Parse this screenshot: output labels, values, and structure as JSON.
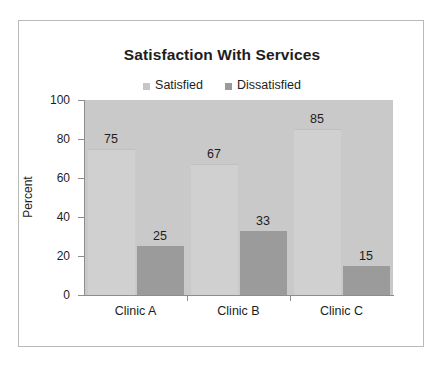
{
  "chart_data": {
    "type": "bar",
    "title": "Satisfaction With Services",
    "xlabel": "",
    "ylabel": "Percent",
    "categories": [
      "Clinic A",
      "Clinic B",
      "Clinic C"
    ],
    "series": [
      {
        "name": "Satisfied",
        "values": [
          75,
          67,
          85
        ],
        "color": "#d0d0d0"
      },
      {
        "name": "Dissatisfied",
        "values": [
          25,
          33,
          15
        ],
        "color": "#9b9b9b"
      }
    ],
    "ylim": [
      0,
      100
    ],
    "yticks": [
      0,
      20,
      40,
      60,
      80,
      100
    ],
    "ytick_labels": [
      "0",
      "20",
      "40",
      "60",
      "80",
      "100"
    ],
    "grid": false,
    "legend_position": "top",
    "plot_background": "#c9c9c9",
    "data_labels": [
      {
        "category": "Clinic A",
        "series": "Satisfied",
        "value": 75,
        "text": "75"
      },
      {
        "category": "Clinic A",
        "series": "Dissatisfied",
        "value": 25,
        "text": "25"
      },
      {
        "category": "Clinic B",
        "series": "Satisfied",
        "value": 67,
        "text": "67"
      },
      {
        "category": "Clinic B",
        "series": "Dissatisfied",
        "value": 33,
        "text": "33"
      },
      {
        "category": "Clinic C",
        "series": "Satisfied",
        "value": 85,
        "text": "85"
      },
      {
        "category": "Clinic C",
        "series": "Dissatisfied",
        "value": 15,
        "text": "15"
      }
    ]
  },
  "legend": {
    "items": [
      {
        "label": "Satisfied",
        "color": "#c6c6c6"
      },
      {
        "label": "Dissatisfied",
        "color": "#9b9b9b"
      }
    ]
  },
  "frame": {
    "border_color": "#b9b9b9"
  }
}
